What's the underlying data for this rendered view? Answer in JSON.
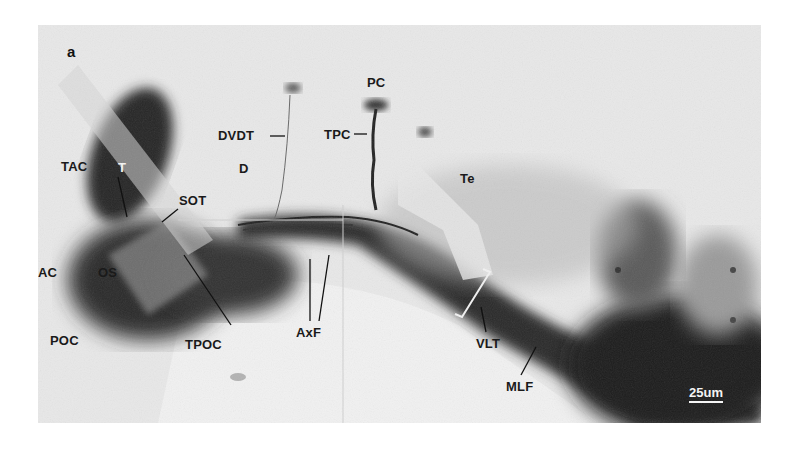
{
  "figure": {
    "panel_letter": "a",
    "scale_bar": "25um",
    "labels": {
      "T": "T",
      "TAC": "TAC",
      "SOT": "SOT",
      "AC": "AC",
      "OS": "OS",
      "POC": "POC",
      "TPOC": "TPOC",
      "D": "D",
      "DVDT": "DVDT",
      "PC": "PC",
      "TPC": "TPC",
      "Te": "Te",
      "AxF": "AxF",
      "VLT": "VLT",
      "MLF": "MLF"
    },
    "colors": {
      "background": "#e9e9e9",
      "dark_stain": "#1c1c1c",
      "mid_stain": "#6e6e6e"
    }
  }
}
